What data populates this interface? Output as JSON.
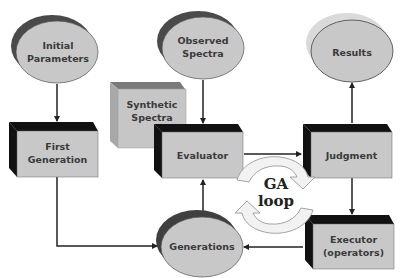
{
  "diagram": {
    "nodes": {
      "initial_parameters": {
        "label_line1": "Initial",
        "label_line2": "Parameters",
        "shape": "ellipse"
      },
      "observed_spectra": {
        "label_line1": "Observed",
        "label_line2": "Spectra",
        "shape": "ellipse"
      },
      "results": {
        "label": "Results",
        "shape": "ellipse"
      },
      "synthetic_spectra": {
        "label_line1": "Synthetic",
        "label_line2": "Spectra",
        "shape": "box-3d"
      },
      "first_generation": {
        "label_line1": "First",
        "label_line2": "Generation",
        "shape": "box-3d"
      },
      "evaluator": {
        "label": "Evaluator",
        "shape": "box-3d"
      },
      "judgment": {
        "label": "Judgment",
        "shape": "box-3d"
      },
      "executor": {
        "label_line1": "Executor",
        "label_line2": "(operators)",
        "shape": "box-3d"
      },
      "generations": {
        "label": "Generations",
        "shape": "ellipse"
      }
    },
    "loop": {
      "label_line1": "GA",
      "label_line2": "loop"
    },
    "edges": [
      {
        "from": "Initial Parameters",
        "to": "First Generation"
      },
      {
        "from": "Observed Spectra",
        "to": "Evaluator"
      },
      {
        "from": "Evaluator",
        "to": "Judgment"
      },
      {
        "from": "Judgment",
        "to": "Results"
      },
      {
        "from": "Judgment",
        "to": "Executor (operators)"
      },
      {
        "from": "Executor (operators)",
        "to": "Generations"
      },
      {
        "from": "Generations",
        "to": "Evaluator"
      },
      {
        "from": "First Generation",
        "to": "Generations"
      }
    ],
    "colors": {
      "node_fill": "#c8c8c8",
      "box_side_dark": "#111111",
      "ellipse_shadow_dark": "#4a4a4a",
      "results_shadow": "#d8d8d8",
      "synthetic_side": "#9a9a9a",
      "loop_fill": "#f2f2f2",
      "line": "#222222"
    }
  }
}
